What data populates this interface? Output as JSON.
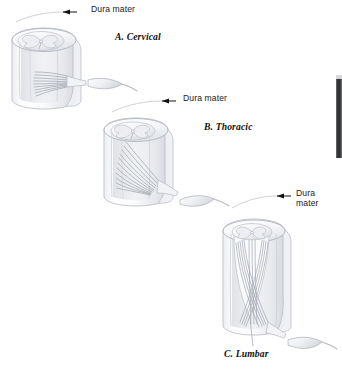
{
  "figure": {
    "background_color": "#ffffff",
    "ink_color": "#1a1a1a",
    "structure_outline_color": "#b9bcc2",
    "structure_fill_light": "#fbfbfc",
    "structure_fill_shade": "#e4e6ea",
    "panels": [
      {
        "id": "cervical",
        "caption": "A. Cervical",
        "callout": "Dura mater",
        "callout_lines": 1,
        "rootlet_obliquity": "nearly horizontal",
        "rootlet_count": 9
      },
      {
        "id": "thoracic",
        "caption": "B. Thoracic",
        "callout": "Dura mater",
        "callout_lines": 1,
        "rootlet_obliquity": "moderately oblique",
        "rootlet_count": 11
      },
      {
        "id": "lumbar",
        "caption": "C. Lumbar",
        "callout": "Dura\nmater",
        "callout_lines": 2,
        "rootlet_obliquity": "steeply vertical",
        "rootlet_count": 12
      }
    ]
  },
  "artifact": {
    "edge_bar_color": "#2e2f31",
    "edge_bar_cap_color": "#d8d8da"
  }
}
